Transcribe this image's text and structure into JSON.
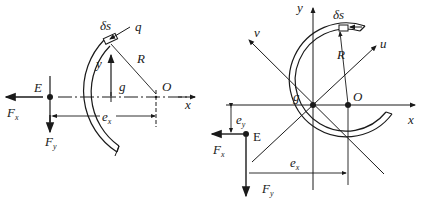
{
  "diagram": {
    "left_figure": {
      "title": "Open circular arc section (shear center E)",
      "labels": {
        "ds": "δs",
        "q": "q",
        "R": "R",
        "y": "y",
        "g": "g",
        "O": "O",
        "x": "x",
        "E": "E",
        "Fx": "F",
        "Fx_sub": "x",
        "Fy": "F",
        "Fy_sub": "y",
        "ex": "e",
        "ex_sub": "x"
      }
    },
    "right_figure": {
      "title": "Open circular ring section with principal axes u, v",
      "labels": {
        "y": "y",
        "ds": "δs",
        "v": "v",
        "u": "u",
        "R": "R",
        "g": "g",
        "O": "O",
        "x": "x",
        "E": "E",
        "ey": "e",
        "ey_sub": "y",
        "Fx": "F",
        "Fx_sub": "x",
        "ex": "e",
        "ex_sub": "x",
        "Fy": "F",
        "Fy_sub": "y"
      }
    },
    "colors": {
      "ink": "#1a1a1a",
      "background": "#ffffff"
    }
  }
}
